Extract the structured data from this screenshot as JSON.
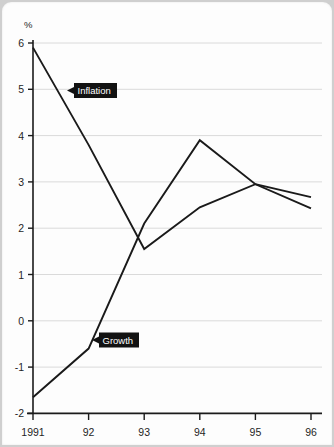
{
  "chart_data": {
    "type": "line",
    "title": "",
    "xlabel": "",
    "ylabel": "%",
    "ylim": [
      -2,
      6
    ],
    "yticks": [
      "6",
      "5",
      "4",
      "3",
      "2",
      "1",
      "0",
      "-1",
      "-2"
    ],
    "ytick_values": [
      6,
      5,
      4,
      3,
      2,
      1,
      0,
      -1,
      -2
    ],
    "categories": [
      "1991",
      "92",
      "93",
      "94",
      "95",
      "96"
    ],
    "x": [
      1991,
      1992,
      1993,
      1994,
      1995,
      1996
    ],
    "grid": true,
    "legend": "inline-callouts",
    "series": [
      {
        "name": "Inflation",
        "values": [
          5.9,
          3.8,
          1.55,
          2.45,
          2.95,
          2.43
        ]
      },
      {
        "name": "Growth",
        "values": [
          -1.65,
          -0.6,
          2.1,
          3.9,
          2.95,
          2.67
        ]
      }
    ],
    "annotations": [
      {
        "label": "Inflation",
        "target_x": 1991.35,
        "target_y": 4.82,
        "box_x": 1991.5,
        "box_y": 4.82
      },
      {
        "label": "Growth",
        "target_x": 1992.35,
        "target_y": -0.42,
        "box_x": 1992.5,
        "box_y": -0.42
      }
    ],
    "colors": {
      "line": "#1a1a1a",
      "grid": "#dadada",
      "axis": "#1b1b1b",
      "callout_bg": "#121212",
      "callout_fg": "#ffffff",
      "card_bg": "#fdfdfd",
      "page_bg": "#cfcfcf"
    }
  }
}
